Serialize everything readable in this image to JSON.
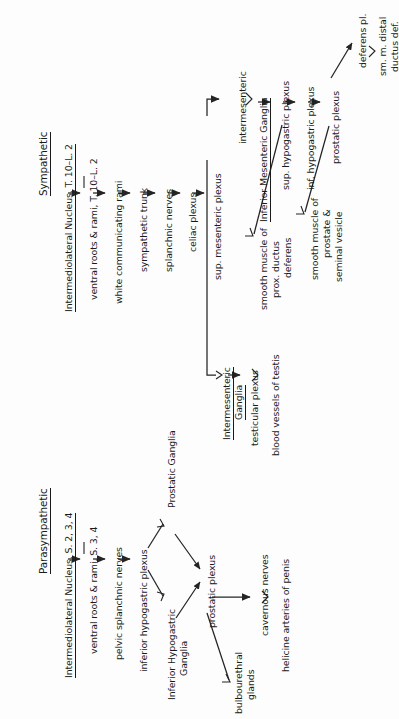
{
  "diagram": {
    "title_sympathetic": "Sympathetic",
    "title_parasympathetic": "Parasympathetic",
    "sympathetic": {
      "chain": [
        "Intermediolateral Nucleus, T. 10–L. 2",
        "ventral roots & rami, T. 10–L. 2",
        "white communicating rami",
        "sympathetic trunk",
        "splanchnic nerves",
        "celiac plexus",
        "sup. mesenteric plexus"
      ],
      "intermesenteric": "intermesenteric",
      "inferior_mesenteric_ganglia": "Inferior Mesenteric Ganglia",
      "sup_hypogastric_plexus": "sup. hypogastric plexus",
      "inf_hypogastric_plexus": "inf. hypogastric plexus",
      "prostatic_plexus": "prostatic plexus",
      "deferens_pl": "deferens pl.",
      "sm_m_distal": "sm. m. distal",
      "ductus_def": "ductus def.",
      "smooth_muscle_prostate_1": "smooth muscle of",
      "smooth_muscle_prostate_2": "prostate &",
      "smooth_muscle_prostate_3": "seminal vesicle",
      "smooth_muscle_prox_1": "smooth muscle of",
      "smooth_muscle_prox_2": "prox. ductus",
      "smooth_muscle_prox_3": "deferens",
      "intermesenteric_ganglia_1": "Intermesenteric",
      "intermesenteric_ganglia_2": "Ganglia",
      "testicular_plexus": "testicular plexus",
      "blood_vessels_of_testis": "blood vessels of testis"
    },
    "parasympathetic": {
      "chain": [
        "Intermediolateral Nucleus, S. 2, 3, 4",
        "ventral roots & rami, S. 3, 4",
        "pelvic splanchnic nerves",
        "inferior hypogastric plexus"
      ],
      "prostatic_ganglia": "Prostatic Ganglia",
      "inferior_hypogastric_ganglia_1": "Inferior Hypogastric",
      "inferior_hypogastric_ganglia_2": "Ganglia",
      "prostatic_plexus": "prostatic plexus",
      "cavernous_nerves": "cavernous nerves",
      "helicine_arteries": "helicine arteries of penis",
      "bulbourethral_1": "bulbourethral",
      "bulbourethral_2": "glands"
    }
  }
}
